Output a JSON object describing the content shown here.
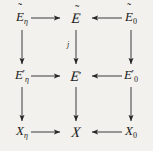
{
  "figure": {
    "kind": "commutative-diagram",
    "background_color": "#f2f1ee",
    "ink_color": "#262626",
    "rows": 3,
    "columns": 3,
    "nodes": [
      {
        "id": "r0c0",
        "latex": "\\tilde{E}_{\\eta}",
        "base": "E",
        "accent": "~",
        "sub": "η",
        "prime": false,
        "script": false
      },
      {
        "id": "r0c1",
        "latex": "\\tilde{\\mathscr{E}}",
        "base": "E",
        "accent": "~",
        "sub": "",
        "prime": false,
        "script": true
      },
      {
        "id": "r0c2",
        "latex": "\\tilde{E}_{0}",
        "base": "E",
        "accent": "~",
        "sub": "0",
        "prime": false,
        "script": false
      },
      {
        "id": "r1c0",
        "latex": "E'_{\\eta}",
        "base": "E",
        "accent": "",
        "sub": "η",
        "prime": true,
        "script": false
      },
      {
        "id": "r1c1",
        "latex": "\\mathscr{E}'",
        "base": "E",
        "accent": "",
        "sub": "",
        "prime": true,
        "script": true
      },
      {
        "id": "r1c2",
        "latex": "E'_{0}",
        "base": "E",
        "accent": "",
        "sub": "0",
        "prime": true,
        "script": false
      },
      {
        "id": "r2c0",
        "latex": "X_{\\eta}",
        "base": "X",
        "accent": "",
        "sub": "η",
        "prime": false,
        "script": false
      },
      {
        "id": "r2c1",
        "latex": "\\mathscr{X}",
        "base": "X",
        "accent": "",
        "sub": "",
        "prime": false,
        "script": true
      },
      {
        "id": "r2c2",
        "latex": "X_{0}",
        "base": "X",
        "accent": "",
        "sub": "0",
        "prime": false,
        "script": false
      }
    ],
    "node_text": {
      "r0c0_base": "E",
      "r0c0_tilde": "˜",
      "r0c0_sub": "η",
      "r0c1_base": "E",
      "r0c1_tilde": "˜",
      "r0c2_base": "E",
      "r0c2_tilde": "˜",
      "r0c2_sub": "0",
      "r1c0_base": "E",
      "r1c0_prime": "′",
      "r1c0_sub": "η",
      "r1c1_base": "E",
      "r1c1_prime": "′",
      "r1c2_base": "E",
      "r1c2_prime": "′",
      "r1c2_sub": "0",
      "r2c0_base": "X",
      "r2c0_sub": "η",
      "r2c1_base": "X",
      "r2c2_base": "X",
      "r2c2_sub": "0"
    },
    "arrows": [
      {
        "id": "a-top-left",
        "from": "r0c0",
        "to": "r0c1",
        "direction": "right",
        "label": ""
      },
      {
        "id": "a-top-right",
        "from": "r0c2",
        "to": "r0c1",
        "direction": "left",
        "label": ""
      },
      {
        "id": "a-mid-left",
        "from": "r1c0",
        "to": "r1c1",
        "direction": "right",
        "label": ""
      },
      {
        "id": "a-mid-right",
        "from": "r1c2",
        "to": "r1c1",
        "direction": "left",
        "label": ""
      },
      {
        "id": "a-bot-left",
        "from": "r2c0",
        "to": "r2c1",
        "direction": "right",
        "label": ""
      },
      {
        "id": "a-bot-right",
        "from": "r2c2",
        "to": "r2c1",
        "direction": "left",
        "label": ""
      },
      {
        "id": "a-col0-upper",
        "from": "r0c0",
        "to": "r1c0",
        "direction": "down",
        "label": ""
      },
      {
        "id": "a-col0-lower",
        "from": "r1c0",
        "to": "r2c0",
        "direction": "down",
        "label": ""
      },
      {
        "id": "a-col1-upper",
        "from": "r0c1",
        "to": "r1c1",
        "direction": "down",
        "label": "j"
      },
      {
        "id": "a-col1-lower",
        "from": "r1c1",
        "to": "r2c1",
        "direction": "down",
        "label": ""
      },
      {
        "id": "a-col2-upper",
        "from": "r0c2",
        "to": "r1c2",
        "direction": "down",
        "label": ""
      },
      {
        "id": "a-col2-lower",
        "from": "r1c2",
        "to": "r2c2",
        "direction": "down",
        "label": ""
      }
    ],
    "labels": {
      "j": "j"
    }
  }
}
